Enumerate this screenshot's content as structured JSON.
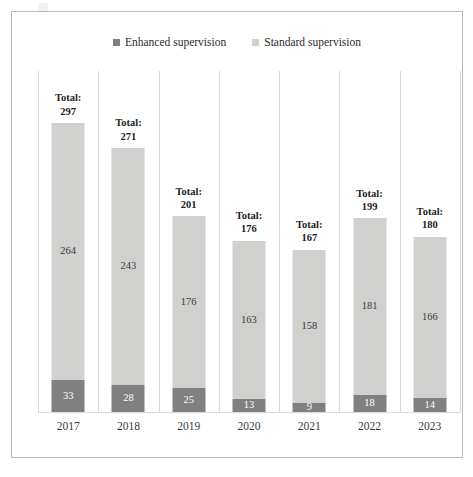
{
  "chart_data": {
    "type": "bar",
    "subtype": "stacked-column",
    "title": "",
    "xlabel": "",
    "ylabel": "",
    "grid": false,
    "ylim": [
      0,
      297
    ],
    "legend_position": "top-center",
    "categories": [
      "2017",
      "2018",
      "2019",
      "2020",
      "2021",
      "2022",
      "2023"
    ],
    "series": [
      {
        "name": "Enhanced supervision",
        "color": "#808080",
        "values": [
          33,
          28,
          25,
          13,
          9,
          18,
          14
        ]
      },
      {
        "name": "Standard supervision",
        "color": "#d0d0cf",
        "values": [
          264,
          243,
          176,
          163,
          158,
          181,
          166
        ]
      }
    ],
    "totals": [
      297,
      271,
      201,
      176,
      167,
      199,
      180
    ],
    "total_label_prefix": "Total:"
  },
  "legend": {
    "entries": [
      {
        "label": "Enhanced supervision",
        "color": "#808080"
      },
      {
        "label": "Standard supervision",
        "color": "#d0d0cf"
      }
    ]
  }
}
